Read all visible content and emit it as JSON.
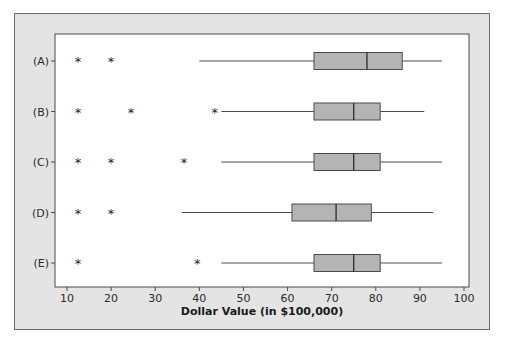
{
  "chart_data": {
    "type": "boxplot",
    "orientation": "horizontal",
    "title": "",
    "xlabel": "Dollar Value (in $100,000)",
    "ylabel": "",
    "xlim": [
      7.5,
      101.5
    ],
    "xticks": [
      10,
      20,
      30,
      40,
      50,
      60,
      70,
      80,
      90,
      100
    ],
    "grid": false,
    "legend": null,
    "categories": [
      "(A)",
      "(B)",
      "(C)",
      "(D)",
      "(E)"
    ],
    "series": [
      {
        "name": "(A)",
        "whisker_low": 40,
        "q1": 66,
        "median": 78,
        "q3": 86,
        "whisker_high": 95,
        "outliers": [
          12.5,
          20
        ]
      },
      {
        "name": "(B)",
        "whisker_low": 45,
        "q1": 66,
        "median": 75,
        "q3": 81,
        "whisker_high": 91,
        "outliers": [
          12.5,
          24.5,
          43.5
        ]
      },
      {
        "name": "(C)",
        "whisker_low": 45,
        "q1": 66,
        "median": 75,
        "q3": 81,
        "whisker_high": 95,
        "outliers": [
          12.5,
          20,
          36.5
        ]
      },
      {
        "name": "(D)",
        "whisker_low": 36,
        "q1": 61,
        "median": 71,
        "q3": 79,
        "whisker_high": 93,
        "outliers": [
          12.5,
          20
        ]
      },
      {
        "name": "(E)",
        "whisker_low": 45,
        "q1": 66,
        "median": 75,
        "q3": 81,
        "whisker_high": 95,
        "outliers": [
          12.5,
          39.5
        ]
      }
    ],
    "colors": {
      "box_fill": "#b4b4b4",
      "box_stroke": "#4a4a4a",
      "panel_bg": "#e4e4e4",
      "plot_bg": "#ffffff"
    }
  }
}
